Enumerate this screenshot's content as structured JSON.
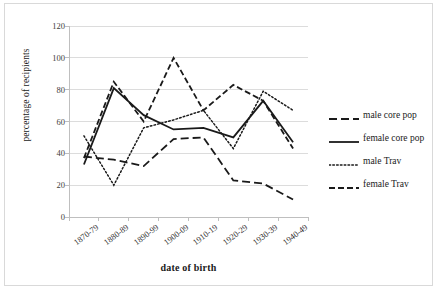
{
  "chart_data": {
    "type": "line",
    "title": "",
    "xlabel": "date of birth",
    "ylabel": "percentage of recipients",
    "categories": [
      "1870-79",
      "1880-89",
      "1890-99",
      "1900-09",
      "1910-19",
      "1920-29",
      "1930-39",
      "1940-49"
    ],
    "ylim": [
      0,
      120
    ],
    "y_ticks": [
      0,
      20,
      40,
      60,
      80,
      100,
      120
    ],
    "grid": true,
    "legend_position": "right",
    "series": [
      {
        "name": "male core pop",
        "style": "long-dash",
        "color": "#1a1a1a",
        "values": [
          38,
          36,
          32,
          49,
          50,
          23,
          21,
          11
        ]
      },
      {
        "name": "female core pop",
        "style": "solid",
        "color": "#1a1a1a",
        "values": [
          33,
          81,
          64,
          55,
          56,
          50,
          73,
          47
        ]
      },
      {
        "name": "male Trav",
        "style": "dotted",
        "color": "#1a1a1a",
        "values": [
          51,
          20,
          56,
          61,
          67,
          43,
          79,
          67
        ]
      },
      {
        "name": "female Trav",
        "style": "dash-dot",
        "color": "#1a1a1a",
        "values": [
          37,
          85,
          60,
          100,
          67,
          83,
          73,
          43
        ]
      }
    ]
  },
  "axes": {
    "y_tick_labels": [
      "120",
      "100",
      "80",
      "60",
      "40",
      "20",
      "0"
    ],
    "y_title": "percentage of recipients",
    "x_title": "date of birth",
    "x_tick_labels": [
      "1870-79",
      "1880-89",
      "1890-99",
      "1900-09",
      "1910-19",
      "1920-29",
      "1930-39",
      "1940-49"
    ]
  },
  "legend": {
    "items": [
      {
        "label": "male core pop"
      },
      {
        "label": "female core pop"
      },
      {
        "label": "male Trav"
      },
      {
        "label": "female Trav"
      }
    ]
  },
  "colors": {
    "line": "#1a1a1a",
    "grid": "#dcdcdc",
    "axis": "#bfbfbf",
    "frame": "#d9d9d9"
  }
}
